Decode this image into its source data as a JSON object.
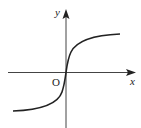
{
  "diagram": {
    "type": "function-graph",
    "x_axis_label": "x",
    "y_axis_label": "y",
    "origin_label": "O",
    "curve_description": "increasing curve through origin, vertical tangent at O, approaching horizontal asymptotes on both sides"
  },
  "colors": {
    "axis": "#222222",
    "curve": "#222222",
    "background": "#ffffff"
  }
}
